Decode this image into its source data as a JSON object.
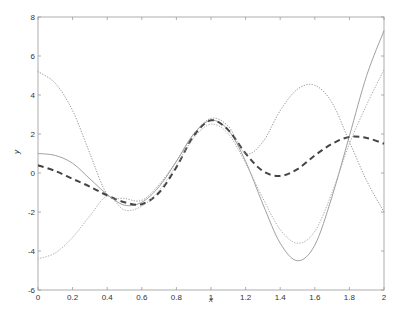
{
  "chart_data": {
    "type": "line",
    "title": "",
    "xlabel": "x",
    "ylabel": "y",
    "xlim": [
      0,
      2
    ],
    "ylim": [
      -6,
      8
    ],
    "grid": false,
    "legend": null,
    "x_ticks": [
      "0",
      "0.2",
      "0.4",
      "0.6",
      "0.8",
      "1",
      "1.2",
      "1.4",
      "1.6",
      "1.8",
      "2"
    ],
    "y_ticks": [
      "-6",
      "-4",
      "-2",
      "0",
      "2",
      "4",
      "6",
      "8"
    ],
    "x": [
      0,
      0.1,
      0.2,
      0.3,
      0.4,
      0.5,
      0.6,
      0.7,
      0.8,
      0.9,
      1.0,
      1.1,
      1.2,
      1.3,
      1.4,
      1.5,
      1.6,
      1.7,
      1.8,
      1.9,
      2.0
    ],
    "series": [
      {
        "name": "solid",
        "style": "solid",
        "color": "#888888",
        "width": 0.8,
        "values": [
          1.0,
          0.9,
          0.5,
          -0.3,
          -1.1,
          -1.65,
          -1.5,
          -0.7,
          0.6,
          2.0,
          2.7,
          2.2,
          0.6,
          -1.6,
          -3.6,
          -4.5,
          -3.7,
          -1.2,
          1.9,
          5.0,
          7.3
        ]
      },
      {
        "name": "dashed",
        "style": "dashed",
        "color": "#444444",
        "width": 2,
        "values": [
          0.4,
          0.1,
          -0.3,
          -0.7,
          -1.15,
          -1.5,
          -1.6,
          -1.0,
          0.3,
          1.9,
          2.7,
          2.2,
          1.0,
          0.1,
          -0.15,
          0.2,
          0.9,
          1.5,
          1.85,
          1.8,
          1.5
        ]
      },
      {
        "name": "dotted-upper-start",
        "style": "dotted",
        "color": "#999999",
        "width": 1,
        "values": [
          5.2,
          4.6,
          3.2,
          1.0,
          -1.1,
          -1.3,
          -1.4,
          -0.6,
          0.6,
          2.0,
          2.8,
          2.4,
          1.0,
          1.6,
          3.2,
          4.3,
          4.5,
          3.6,
          1.6,
          -0.4,
          -2.0
        ]
      },
      {
        "name": "dotted-lower-start",
        "style": "dotted",
        "color": "#aaaaaa",
        "width": 1,
        "values": [
          -4.4,
          -4.1,
          -3.3,
          -2.2,
          -1.2,
          -1.9,
          -1.7,
          -0.9,
          0.4,
          1.8,
          2.5,
          2.0,
          0.5,
          -1.3,
          -2.9,
          -3.6,
          -3.0,
          -1.0,
          1.5,
          3.5,
          5.3
        ]
      }
    ]
  },
  "axes": {
    "xlabel": "x",
    "ylabel": "y"
  }
}
